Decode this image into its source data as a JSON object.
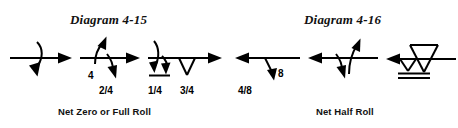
{
  "page": {
    "background_color": "#ffffff",
    "ink_color": "#000000",
    "width": 458,
    "height": 128
  },
  "diagrams": [
    {
      "id": "diagram-4-15",
      "title": "Diagram 4-15",
      "caption": "Net Zero or Full Roll",
      "figures": [
        {
          "id": "figure-1",
          "name": "full-roll-symbol",
          "direction": "right",
          "labels": []
        },
        {
          "id": "figure-2",
          "name": "two-quarter-roll-symbol",
          "direction": "right",
          "labels": [
            {
              "name": "roll-rate-label",
              "text": "4"
            },
            {
              "name": "roll-fraction-label",
              "text": "2/4"
            }
          ]
        },
        {
          "id": "figure-3",
          "name": "quarter-and-three-quarter-roll-symbol",
          "direction": "right",
          "labels": [
            {
              "name": "roll-fraction-label-quarter",
              "text": "1/4"
            },
            {
              "name": "roll-fraction-label-three-quarter",
              "text": "3/4"
            }
          ]
        }
      ]
    },
    {
      "id": "diagram-4-16",
      "title": "Diagram 4-16",
      "caption": "Net Half Roll",
      "figures": [
        {
          "id": "figure-4",
          "name": "half-roll-eight-point-symbol",
          "direction": "left",
          "labels": [
            {
              "name": "roll-rate-label",
              "text": "8"
            },
            {
              "name": "roll-fraction-label",
              "text": "4/8"
            }
          ]
        },
        {
          "id": "figure-5",
          "name": "opposing-quarter-rolls-symbol",
          "direction": "left",
          "labels": []
        },
        {
          "id": "figure-6",
          "name": "snap-roll-triangle-symbol",
          "direction": "left",
          "labels": []
        }
      ]
    }
  ]
}
